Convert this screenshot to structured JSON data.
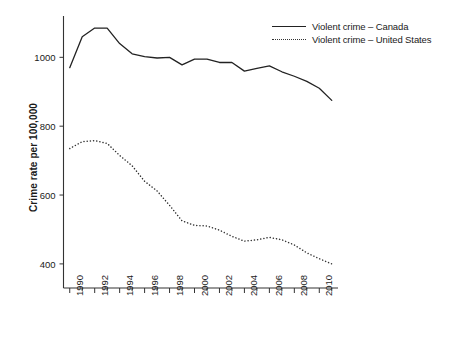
{
  "chart_data": {
    "type": "line",
    "title": "",
    "xlabel": "",
    "ylabel": "Crime rate per 100,000",
    "xlim": [
      1989.5,
      2011.5
    ],
    "ylim": [
      330,
      1120
    ],
    "yticks": [
      400,
      600,
      800,
      1000
    ],
    "ytick_labels": [
      "400",
      "600",
      "800",
      "1000"
    ],
    "xticks": [
      1990,
      1992,
      1994,
      1996,
      1998,
      2000,
      2002,
      2004,
      2006,
      2008,
      2010
    ],
    "xtick_labels": [
      "1990",
      "1992",
      "1994",
      "1996",
      "1998",
      "2000",
      "2002",
      "2004",
      "2006",
      "2008",
      "2010"
    ],
    "x": [
      1990,
      1991,
      1992,
      1993,
      1994,
      1995,
      1996,
      1997,
      1998,
      1999,
      2000,
      2001,
      2002,
      2003,
      2004,
      2005,
      2006,
      2007,
      2008,
      2009,
      2010,
      2011
    ],
    "grid": false,
    "legend_position": "top-right",
    "series": [
      {
        "name": "Violent crime – Canada",
        "style": "solid",
        "color": "#222222",
        "values": [
          970,
          1060,
          1085,
          1085,
          1040,
          1010,
          1002,
          998,
          1000,
          978,
          995,
          995,
          985,
          985,
          960,
          968,
          975,
          958,
          945,
          930,
          910,
          875
        ]
      },
      {
        "name": "Violent crime – United States",
        "style": "dotted",
        "color": "#333333",
        "values": [
          735,
          755,
          758,
          750,
          715,
          685,
          640,
          612,
          570,
          525,
          512,
          510,
          498,
          480,
          466,
          470,
          477,
          470,
          455,
          432,
          415,
          400
        ]
      }
    ]
  },
  "legend": {
    "items": [
      {
        "label": "Violent crime – Canada",
        "style": "solid"
      },
      {
        "label": "Violent crime – United States",
        "style": "dotted"
      }
    ]
  },
  "axes": {
    "y_title": "Crime rate per 100,000"
  }
}
